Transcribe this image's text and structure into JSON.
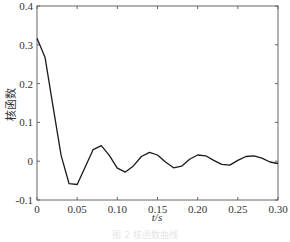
{
  "chart_data": {
    "type": "line",
    "title": "",
    "xlabel": "t/s",
    "ylabel": "核函数",
    "xlim": [
      0,
      0.3
    ],
    "ylim": [
      -0.1,
      0.4
    ],
    "xticks": [
      "0",
      "0.05",
      "0.10",
      "0.15",
      "0.20",
      "0.25",
      "0.30"
    ],
    "xtick_values": [
      0,
      0.05,
      0.1,
      0.15,
      0.2,
      0.25,
      0.3
    ],
    "yticks": [
      "-0.1",
      "0",
      "0.1",
      "0.2",
      "0.3",
      "0.4"
    ],
    "ytick_values": [
      -0.1,
      0,
      0.1,
      0.2,
      0.3,
      0.4
    ],
    "grid": false,
    "legend": null,
    "series": [
      {
        "name": "核函数",
        "color": "#1a1a1a",
        "x": [
          0,
          0.01,
          0.02,
          0.03,
          0.04,
          0.05,
          0.06,
          0.07,
          0.08,
          0.09,
          0.1,
          0.11,
          0.12,
          0.13,
          0.14,
          0.15,
          0.16,
          0.17,
          0.18,
          0.19,
          0.2,
          0.21,
          0.22,
          0.23,
          0.24,
          0.25,
          0.26,
          0.27,
          0.28,
          0.29,
          0.3
        ],
        "values": [
          0.317,
          0.268,
          0.14,
          0.015,
          -0.058,
          -0.06,
          -0.015,
          0.03,
          0.04,
          0.015,
          -0.018,
          -0.028,
          -0.012,
          0.012,
          0.023,
          0.016,
          -0.002,
          -0.017,
          -0.013,
          0.005,
          0.016,
          0.014,
          0.002,
          -0.008,
          -0.01,
          0.002,
          0.012,
          0.014,
          0.008,
          -0.002,
          -0.006
        ]
      }
    ]
  },
  "caption": "图 2  核函数曲线"
}
